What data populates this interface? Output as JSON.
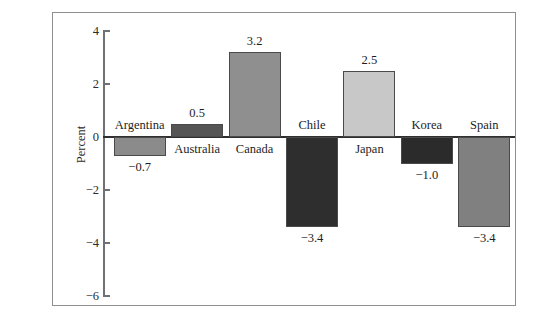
{
  "chart_data": {
    "type": "bar",
    "title": "",
    "subtitle": "",
    "xlabel": "",
    "ylabel": "Percent",
    "ylim": [
      -6,
      4
    ],
    "yticks": [
      4,
      2,
      0,
      -2,
      -4,
      -6
    ],
    "ytick_labels": [
      "4",
      "2",
      "0",
      "−2",
      "−4",
      "−6"
    ],
    "grid": false,
    "legend": null,
    "zero_line": true,
    "categories": [
      "Argentina",
      "Australia",
      "Canada",
      "Chile",
      "Japan",
      "Korea",
      "Spain"
    ],
    "values": [
      -0.7,
      0.5,
      3.2,
      -3.4,
      2.5,
      -1.0,
      -3.4
    ],
    "value_labels": [
      "−0.7",
      "0.5",
      "3.2",
      "−3.4",
      "2.5",
      "−1.0",
      "−3.4"
    ],
    "bar_colors": [
      "#8b8b8b",
      "#555555",
      "#8f8f8f",
      "#2e2e2e",
      "#c8c8c8",
      "#2b2b2b",
      "#808080"
    ],
    "bars": [
      {
        "label": "Argentina",
        "value": -0.7,
        "value_label": "−0.7",
        "color": "#8b8b8b"
      },
      {
        "label": "Australia",
        "value": 0.5,
        "value_label": "0.5",
        "color": "#555555"
      },
      {
        "label": "Canada",
        "value": 3.2,
        "value_label": "3.2",
        "color": "#8f8f8f"
      },
      {
        "label": "Chile",
        "value": -3.4,
        "value_label": "−3.4",
        "color": "#2e2e2e"
      },
      {
        "label": "Japan",
        "value": 2.5,
        "value_label": "2.5",
        "color": "#c8c8c8"
      },
      {
        "label": "Korea",
        "value": -1.0,
        "value_label": "−1.0",
        "color": "#2b2b2b"
      },
      {
        "label": "Spain",
        "value": -3.4,
        "value_label": "−3.4",
        "color": "#808080"
      }
    ]
  },
  "colors": {
    "frame_border": "#8d8f93",
    "axis": "#6f7175",
    "zero_line": "#2f2f2f",
    "text": "#1d1d1d",
    "background": "#ffffff"
  },
  "axis": {
    "ylabel": "Percent",
    "tick_labels": [
      "4",
      "2",
      "0",
      "−2",
      "−4",
      "−6"
    ]
  }
}
